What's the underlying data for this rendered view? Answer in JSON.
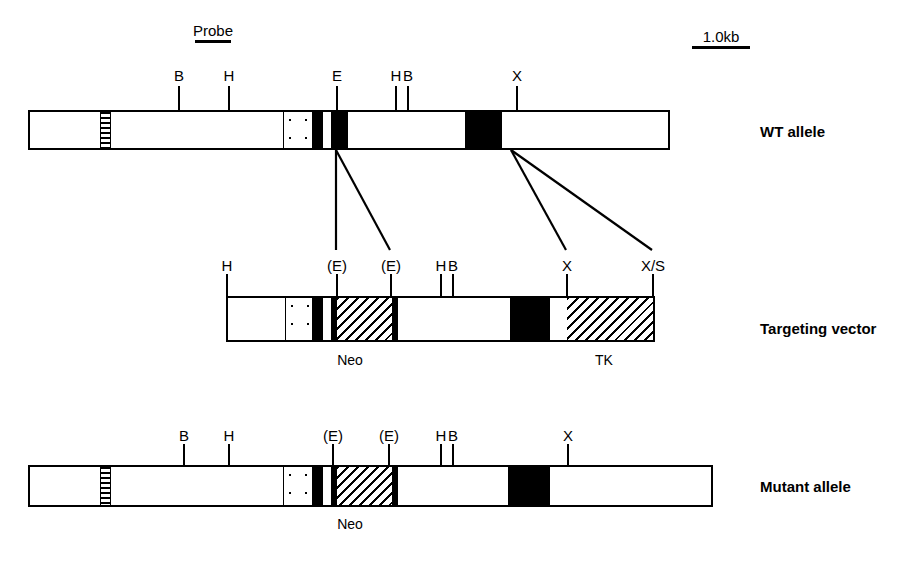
{
  "figure": {
    "width": 924,
    "height": 571,
    "background": "#ffffff",
    "ink": "#000000"
  },
  "scale_bar": {
    "label": "1.0kb",
    "label_x": 721,
    "label_y": 28,
    "rule_x": 692,
    "rule_y": 46,
    "rule_width": 58
  },
  "probe": {
    "label": "Probe",
    "label_x": 213,
    "label_y": 22,
    "rule_x": 195,
    "rule_y": 40,
    "rule_width": 36
  },
  "rows": [
    {
      "id": "wt-allele",
      "name": "WT allele",
      "name_x": 760,
      "name_y": 123,
      "bar": {
        "x": 28,
        "y": 110,
        "width": 642,
        "height": 40
      },
      "segments": [
        {
          "kind": "hstripe",
          "x": 100,
          "y": 112,
          "width": 11,
          "height": 36
        },
        {
          "kind": "dots",
          "x": 283,
          "y": 112,
          "width": 30,
          "height": 36
        },
        {
          "kind": "black",
          "x": 313,
          "y": 112,
          "width": 10,
          "height": 36
        },
        {
          "kind": "white",
          "x": 323,
          "y": 112,
          "width": 8,
          "height": 36
        },
        {
          "kind": "black",
          "x": 331,
          "y": 112,
          "width": 17,
          "height": 36
        },
        {
          "kind": "black",
          "x": 465,
          "y": 112,
          "width": 37,
          "height": 36
        }
      ],
      "sites": [
        {
          "label": "B",
          "x": 178,
          "label_y": 68,
          "tick_y": 86,
          "tick_h": 24
        },
        {
          "label": "H",
          "x": 228,
          "label_y": 68,
          "tick_y": 86,
          "tick_h": 24
        },
        {
          "label": "E",
          "x": 336,
          "label_y": 68,
          "tick_y": 86,
          "tick_h": 24
        },
        {
          "label": "H",
          "x": 395,
          "label_y": 68,
          "tick_y": 86,
          "tick_h": 24
        },
        {
          "label": "B",
          "x": 407,
          "label_y": 68,
          "tick_y": 86,
          "tick_h": 24
        },
        {
          "label": "X",
          "x": 516,
          "label_y": 68,
          "tick_y": 86,
          "tick_h": 24
        }
      ],
      "under_labels": []
    },
    {
      "id": "targeting-vector",
      "name": "Targeting vector",
      "name_x": 760,
      "name_y": 320,
      "bar": {
        "x": 226,
        "y": 296,
        "width": 429,
        "height": 46
      },
      "segments": [
        {
          "kind": "dots",
          "x": 285,
          "y": 298,
          "width": 28,
          "height": 42
        },
        {
          "kind": "black",
          "x": 313,
          "y": 298,
          "width": 10,
          "height": 42
        },
        {
          "kind": "white",
          "x": 323,
          "y": 298,
          "width": 8,
          "height": 42
        },
        {
          "kind": "black",
          "x": 331,
          "y": 298,
          "width": 6,
          "height": 42
        },
        {
          "kind": "diag",
          "x": 337,
          "y": 298,
          "width": 55,
          "height": 42
        },
        {
          "kind": "black",
          "x": 392,
          "y": 298,
          "width": 6,
          "height": 42
        },
        {
          "kind": "black",
          "x": 510,
          "y": 298,
          "width": 40,
          "height": 42
        },
        {
          "kind": "white",
          "x": 550,
          "y": 298,
          "width": 17,
          "height": 42
        },
        {
          "kind": "diag",
          "x": 567,
          "y": 298,
          "width": 86,
          "height": 42
        }
      ],
      "sites": [
        {
          "label": "H",
          "x": 226,
          "label_y": 258,
          "tick_y": 274,
          "tick_h": 22
        },
        {
          "label": "(E)",
          "x": 336,
          "label_y": 258,
          "tick_y": 274,
          "tick_h": 22
        },
        {
          "label": "(E)",
          "x": 390,
          "label_y": 258,
          "tick_y": 274,
          "tick_h": 22
        },
        {
          "label": "H",
          "x": 440,
          "label_y": 258,
          "tick_y": 274,
          "tick_h": 22
        },
        {
          "label": "B",
          "x": 452,
          "label_y": 258,
          "tick_y": 274,
          "tick_h": 22
        },
        {
          "label": "X",
          "x": 566,
          "label_y": 258,
          "tick_y": 274,
          "tick_h": 22
        },
        {
          "label": "X/S",
          "x": 652,
          "label_y": 258,
          "tick_y": 274,
          "tick_h": 22
        }
      ],
      "under_labels": [
        {
          "text": "Neo",
          "x": 350,
          "y": 352
        },
        {
          "text": "TK",
          "x": 604,
          "y": 352
        }
      ]
    },
    {
      "id": "mutant-allele",
      "name": "Mutant allele",
      "name_x": 760,
      "name_y": 478,
      "bar": {
        "x": 28,
        "y": 465,
        "width": 685,
        "height": 42
      },
      "segments": [
        {
          "kind": "hstripe",
          "x": 100,
          "y": 467,
          "width": 11,
          "height": 38
        },
        {
          "kind": "dots",
          "x": 283,
          "y": 467,
          "width": 30,
          "height": 38
        },
        {
          "kind": "black",
          "x": 313,
          "y": 467,
          "width": 10,
          "height": 38
        },
        {
          "kind": "white",
          "x": 323,
          "y": 467,
          "width": 8,
          "height": 38
        },
        {
          "kind": "black",
          "x": 331,
          "y": 467,
          "width": 6,
          "height": 38
        },
        {
          "kind": "diag",
          "x": 337,
          "y": 467,
          "width": 55,
          "height": 38
        },
        {
          "kind": "black",
          "x": 392,
          "y": 467,
          "width": 6,
          "height": 38
        },
        {
          "kind": "black",
          "x": 508,
          "y": 467,
          "width": 42,
          "height": 38
        }
      ],
      "sites": [
        {
          "label": "B",
          "x": 183,
          "label_y": 428,
          "tick_y": 444,
          "tick_h": 21
        },
        {
          "label": "H",
          "x": 228,
          "label_y": 428,
          "tick_y": 444,
          "tick_h": 21
        },
        {
          "label": "(E)",
          "x": 332,
          "label_y": 428,
          "tick_y": 444,
          "tick_h": 21
        },
        {
          "label": "(E)",
          "x": 388,
          "label_y": 428,
          "tick_y": 444,
          "tick_h": 21
        },
        {
          "label": "H",
          "x": 440,
          "label_y": 428,
          "tick_y": 444,
          "tick_h": 21
        },
        {
          "label": "B",
          "x": 452,
          "label_y": 428,
          "tick_y": 444,
          "tick_h": 21
        },
        {
          "label": "X",
          "x": 567,
          "label_y": 428,
          "tick_y": 444,
          "tick_h": 21
        }
      ],
      "under_labels": [
        {
          "text": "Neo",
          "x": 350,
          "y": 516
        }
      ]
    }
  ],
  "connectors": [
    {
      "x1": 336,
      "y1": 150,
      "x2": 336,
      "y2": 250
    },
    {
      "x1": 336,
      "y1": 150,
      "x2": 390,
      "y2": 250
    },
    {
      "x1": 511,
      "y1": 150,
      "x2": 566,
      "y2": 250
    },
    {
      "x1": 511,
      "y1": 150,
      "x2": 652,
      "y2": 250
    }
  ]
}
